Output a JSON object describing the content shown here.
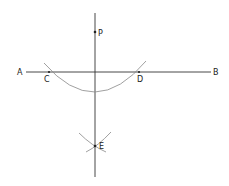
{
  "diagram": {
    "colors": {
      "line": "#333333",
      "arc": "#888888",
      "text": "#222222",
      "background": "#ffffff"
    },
    "points": {
      "A": {
        "label": "A",
        "x": 20,
        "y": 72
      },
      "B": {
        "label": "B",
        "x": 218,
        "y": 72
      },
      "C": {
        "label": "C",
        "x": 49,
        "y": 72
      },
      "D": {
        "label": "D",
        "x": 139,
        "y": 72
      },
      "P": {
        "label": "P",
        "x": 95,
        "y": 32
      },
      "E": {
        "label": "E",
        "x": 95,
        "y": 146
      }
    },
    "lines": [
      {
        "name": "line-AB",
        "from": [
          26,
          72
        ],
        "to": [
          211,
          72
        ]
      },
      {
        "name": "perpendicular-PE",
        "from": [
          95,
          13
        ],
        "to": [
          95,
          177
        ]
      }
    ],
    "arcs": [
      {
        "name": "arc-center-P",
        "center": "P",
        "through": [
          "C",
          "D"
        ]
      },
      {
        "name": "arc-center-C",
        "center": "C",
        "through": [
          "E"
        ]
      },
      {
        "name": "arc-center-D",
        "center": "D",
        "through": [
          "E"
        ]
      }
    ]
  }
}
